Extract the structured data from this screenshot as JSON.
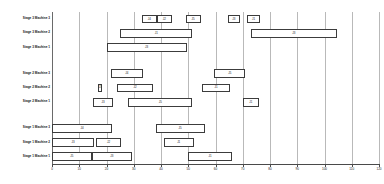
{
  "chart_data": {
    "type": "bar",
    "orientation": "horizontal",
    "subtype": "gantt",
    "title": "",
    "xlabel": "",
    "ylabel": "",
    "xlim": [
      0,
      120
    ],
    "grid": true,
    "legend": "none",
    "x_ticks": [
      0,
      10,
      20,
      30,
      40,
      50,
      60,
      70,
      80,
      90,
      100,
      110,
      120
    ],
    "x_tick_labels": [
      "0",
      "10",
      "20",
      "30",
      "40",
      "50",
      "60",
      "70",
      "80",
      "90",
      "100",
      "110",
      "120"
    ],
    "categories": [
      "Stage 3 Machine 3",
      "Stage 3 Machine 2",
      "Stage 3 Machine 1",
      "Stage 2 Machine 3",
      "Stage 2 Machine 2",
      "Stage 2 Machine 1",
      "Stage 1 Machine 3",
      "Stage 1 Machine 2",
      "Stage 1 Machine 1"
    ],
    "group_gaps_after": [
      2,
      5
    ],
    "tasks": [
      {
        "row": 0,
        "label": "J4",
        "start": 33.0,
        "end": 38.5
      },
      {
        "row": 0,
        "label": "J2",
        "start": 38.5,
        "end": 44.0
      },
      {
        "row": 0,
        "label": "J5",
        "start": 49.0,
        "end": 54.5
      },
      {
        "row": 0,
        "label": "J3",
        "start": 64.5,
        "end": 69.0
      },
      {
        "row": 0,
        "label": "J1",
        "start": 71.5,
        "end": 76.5
      },
      {
        "row": 1,
        "label": "J1",
        "start": 25.0,
        "end": 51.5
      },
      {
        "row": 1,
        "label": "J3",
        "start": 73.0,
        "end": 104.5
      },
      {
        "row": 2,
        "label": "J3",
        "start": 20.0,
        "end": 49.5
      },
      {
        "row": 3,
        "label": "J4",
        "start": 21.5,
        "end": 33.5
      },
      {
        "row": 3,
        "label": "J5",
        "start": 59.5,
        "end": 71.0
      },
      {
        "row": 4,
        "label": "J3",
        "start": 17.0,
        "end": 18.5
      },
      {
        "row": 4,
        "label": "J2",
        "start": 24.0,
        "end": 37.0
      },
      {
        "row": 4,
        "label": "J1",
        "start": 55.0,
        "end": 65.5
      },
      {
        "row": 5,
        "label": "J3",
        "start": 15.0,
        "end": 22.5
      },
      {
        "row": 5,
        "label": "J5",
        "start": 28.0,
        "end": 51.5
      },
      {
        "row": 5,
        "label": "J1",
        "start": 70.0,
        "end": 76.0
      },
      {
        "row": 6,
        "label": "J4",
        "start": 0.0,
        "end": 22.0
      },
      {
        "row": 6,
        "label": "J5",
        "start": 38.0,
        "end": 56.0
      },
      {
        "row": 7,
        "label": "J3",
        "start": 0.0,
        "end": 15.5
      },
      {
        "row": 7,
        "label": "J2",
        "start": 16.0,
        "end": 25.5
      },
      {
        "row": 7,
        "label": "J1",
        "start": 41.0,
        "end": 52.0
      },
      {
        "row": 8,
        "label": "J5",
        "start": 0.0,
        "end": 14.5
      },
      {
        "row": 8,
        "label": "J3",
        "start": 14.5,
        "end": 29.5
      },
      {
        "row": 8,
        "label": "J1",
        "start": 50.0,
        "end": 66.0
      }
    ]
  }
}
